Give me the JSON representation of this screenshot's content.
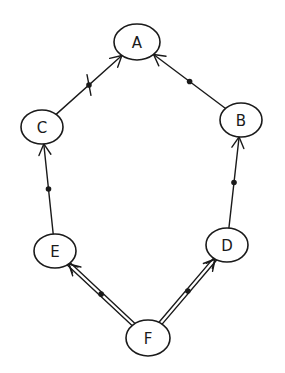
{
  "diagram": {
    "type": "directed-graph",
    "nodes": [
      {
        "id": "A",
        "label": "A",
        "cx": 137,
        "cy": 42,
        "rx": 23,
        "ry": 18
      },
      {
        "id": "B",
        "label": "B",
        "cx": 241,
        "cy": 120,
        "rx": 21,
        "ry": 17
      },
      {
        "id": "C",
        "label": "C",
        "cx": 42,
        "cy": 127,
        "rx": 21,
        "ry": 17
      },
      {
        "id": "D",
        "label": "D",
        "cx": 227,
        "cy": 245,
        "rx": 21,
        "ry": 17
      },
      {
        "id": "E",
        "label": "E",
        "cx": 55,
        "cy": 251,
        "rx": 21,
        "ry": 17
      },
      {
        "id": "F",
        "label": "F",
        "cx": 148,
        "cy": 338,
        "rx": 22,
        "ry": 18
      }
    ],
    "edges": [
      {
        "from": "C",
        "to": "A",
        "style": "single",
        "marker": "dot",
        "crossed": true
      },
      {
        "from": "B",
        "to": "A",
        "style": "single",
        "marker": "dot",
        "crossed": false
      },
      {
        "from": "E",
        "to": "C",
        "style": "single",
        "marker": "dot",
        "crossed": false
      },
      {
        "from": "D",
        "to": "B",
        "style": "single",
        "marker": "dot",
        "crossed": false
      },
      {
        "from": "F",
        "to": "E",
        "style": "double",
        "marker": "dot",
        "crossed": false
      },
      {
        "from": "F",
        "to": "D",
        "style": "double",
        "marker": "dot",
        "crossed": false
      }
    ]
  }
}
